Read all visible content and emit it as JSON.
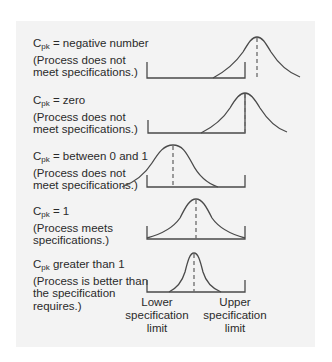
{
  "diagram": {
    "type": "process-capability-comparison",
    "rows": [
      {
        "id": "negative",
        "symbol": "C",
        "subscript": "pk",
        "relation": " = negative number",
        "lines": [
          "(Process does not",
          "meet specifications.)"
        ],
        "curve_center_position": "beyond upper specification limit"
      },
      {
        "id": "zero",
        "symbol": "C",
        "subscript": "pk",
        "relation": " = zero",
        "lines": [
          "(Process does not",
          "meet specifications.)"
        ],
        "curve_center_position": "at upper specification limit"
      },
      {
        "id": "between",
        "symbol": "C",
        "subscript": "pk",
        "relation": " = between 0 and 1",
        "lines": [
          "(Process does not",
          "meet specifications.)"
        ],
        "curve_center_position": "inside limits, tail extends past lower limit"
      },
      {
        "id": "one",
        "symbol": "C",
        "subscript": "pk",
        "relation": " = 1",
        "lines": [
          "(Process meets",
          "specifications.)"
        ],
        "curve_center_position": "centered, tails touch both limits"
      },
      {
        "id": "greater",
        "symbol": "C",
        "subscript": "pk",
        "relation": " greater than 1",
        "lines": [
          "(Process is better than",
          "the specification",
          "requires.)"
        ],
        "curve_center_position": "centered, narrow, well within limits"
      }
    ],
    "axis_labels": {
      "lower": [
        "Lower",
        "specification",
        "limit"
      ],
      "upper": [
        "Upper",
        "specification",
        "limit"
      ]
    },
    "colors": {
      "panel_background": "#f3f3f3",
      "line": "#4a4a4a",
      "dash": "#6a6a6a",
      "text": "#2a2a2a"
    }
  }
}
